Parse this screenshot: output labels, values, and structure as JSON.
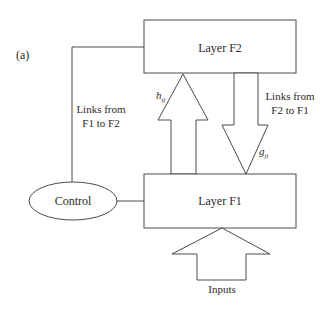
{
  "diagram": {
    "panel_label": "(a)",
    "layer_f2": {
      "label": "Layer F2"
    },
    "layer_f1": {
      "label": "Layer F1"
    },
    "control": {
      "label": "Control"
    },
    "links_f1_to_f2": {
      "line1": "Links from",
      "line2": "F1 to F2"
    },
    "links_f2_to_f1": {
      "line1": "Links from",
      "line2": "F2 to F1"
    },
    "up_weight": {
      "symbol": "h",
      "subscript": "ij"
    },
    "down_weight": {
      "symbol": "g",
      "subscript": "ji"
    },
    "inputs": {
      "label": "Inputs"
    },
    "colors": {
      "stroke": "#4a4a4a",
      "text": "#2a2a2a",
      "background": "#ffffff"
    }
  }
}
